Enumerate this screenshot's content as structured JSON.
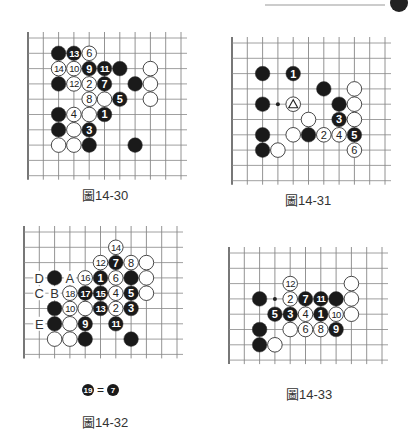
{
  "page_header": {
    "rule_visible": true
  },
  "figures": [
    {
      "id": "fig-14-30",
      "caption": "圖14-30",
      "origin": [
        28,
        38
      ],
      "spacing": 15.3,
      "cols": 11,
      "rows": 10,
      "left_edge": true,
      "stones": [
        {
          "c": 2,
          "r": 1,
          "color": "black",
          "label": ""
        },
        {
          "c": 3,
          "r": 1,
          "color": "black",
          "label": "13"
        },
        {
          "c": 4,
          "r": 1,
          "color": "white",
          "label": "6"
        },
        {
          "c": 2,
          "r": 2,
          "color": "white",
          "label": "14"
        },
        {
          "c": 3,
          "r": 2,
          "color": "white",
          "label": "10"
        },
        {
          "c": 4,
          "r": 2,
          "color": "black",
          "label": "9"
        },
        {
          "c": 5,
          "r": 2,
          "color": "black",
          "label": "11"
        },
        {
          "c": 6,
          "r": 2,
          "color": "black",
          "label": ""
        },
        {
          "c": 8,
          "r": 2,
          "color": "white",
          "label": ""
        },
        {
          "c": 2,
          "r": 3,
          "color": "black",
          "label": ""
        },
        {
          "c": 3,
          "r": 3,
          "color": "white",
          "label": "12"
        },
        {
          "c": 4,
          "r": 3,
          "color": "white",
          "label": "2"
        },
        {
          "c": 5,
          "r": 3,
          "color": "black",
          "label": "7"
        },
        {
          "c": 7,
          "r": 3,
          "color": "black",
          "label": ""
        },
        {
          "c": 8,
          "r": 3,
          "color": "white",
          "label": ""
        },
        {
          "c": 4,
          "r": 4,
          "color": "white",
          "label": "8"
        },
        {
          "c": 5,
          "r": 4,
          "color": "white",
          "label": ""
        },
        {
          "c": 6,
          "r": 4,
          "color": "black",
          "label": "5"
        },
        {
          "c": 8,
          "r": 4,
          "color": "white",
          "label": ""
        },
        {
          "c": 2,
          "r": 5,
          "color": "black",
          "label": ""
        },
        {
          "c": 3,
          "r": 5,
          "color": "white",
          "label": "4"
        },
        {
          "c": 4,
          "r": 5,
          "color": "white",
          "label": ""
        },
        {
          "c": 5,
          "r": 5,
          "color": "black",
          "label": "1"
        },
        {
          "c": 2,
          "r": 6,
          "color": "black",
          "label": ""
        },
        {
          "c": 3,
          "r": 6,
          "color": "white",
          "label": ""
        },
        {
          "c": 4,
          "r": 6,
          "color": "black",
          "label": "3"
        },
        {
          "c": 2,
          "r": 7,
          "color": "white",
          "label": ""
        },
        {
          "c": 3,
          "r": 7,
          "color": "white",
          "label": ""
        },
        {
          "c": 4,
          "r": 7,
          "color": "black",
          "label": ""
        },
        {
          "c": 7,
          "r": 7,
          "color": "black",
          "label": ""
        }
      ],
      "marks": [],
      "letters": []
    },
    {
      "id": "fig-14-31",
      "caption": "圖14-31",
      "origin": [
        232,
        43
      ],
      "spacing": 15.3,
      "cols": 11,
      "rows": 10,
      "left_edge": true,
      "stones": [
        {
          "c": 2,
          "r": 2,
          "color": "black",
          "label": ""
        },
        {
          "c": 4,
          "r": 2,
          "color": "black",
          "label": "1"
        },
        {
          "c": 6,
          "r": 3,
          "color": "black",
          "label": ""
        },
        {
          "c": 8,
          "r": 3,
          "color": "white",
          "label": ""
        },
        {
          "c": 2,
          "r": 4,
          "color": "black",
          "label": ""
        },
        {
          "c": 4,
          "r": 4,
          "color": "white",
          "label": "",
          "triangle": true
        },
        {
          "c": 7,
          "r": 4,
          "color": "black",
          "label": ""
        },
        {
          "c": 8,
          "r": 4,
          "color": "white",
          "label": ""
        },
        {
          "c": 5,
          "r": 5,
          "color": "white",
          "label": ""
        },
        {
          "c": 7,
          "r": 5,
          "color": "black",
          "label": "3"
        },
        {
          "c": 8,
          "r": 5,
          "color": "white",
          "label": ""
        },
        {
          "c": 2,
          "r": 6,
          "color": "black",
          "label": ""
        },
        {
          "c": 4,
          "r": 6,
          "color": "white",
          "label": ""
        },
        {
          "c": 5,
          "r": 6,
          "color": "black",
          "label": ""
        },
        {
          "c": 6,
          "r": 6,
          "color": "white",
          "label": "2"
        },
        {
          "c": 7,
          "r": 6,
          "color": "white",
          "label": "4"
        },
        {
          "c": 8,
          "r": 6,
          "color": "black",
          "label": "5"
        },
        {
          "c": 2,
          "r": 7,
          "color": "black",
          "label": ""
        },
        {
          "c": 3,
          "r": 7,
          "color": "white",
          "label": ""
        },
        {
          "c": 8,
          "r": 7,
          "color": "white",
          "label": "6"
        }
      ],
      "marks": [
        {
          "c": 3,
          "r": 4,
          "type": "hoshi"
        }
      ],
      "letters": []
    },
    {
      "id": "fig-14-32",
      "caption": "圖14-32",
      "origin": [
        24,
        232
      ],
      "spacing": 15.3,
      "cols": 11,
      "rows": 9,
      "left_edge": true,
      "stones": [
        {
          "c": 6,
          "r": 1,
          "color": "white",
          "label": "14"
        },
        {
          "c": 5,
          "r": 2,
          "color": "white",
          "label": "12"
        },
        {
          "c": 6,
          "r": 2,
          "color": "black",
          "label": "7"
        },
        {
          "c": 7,
          "r": 2,
          "color": "white",
          "label": "8"
        },
        {
          "c": 8,
          "r": 2,
          "color": "white",
          "label": ""
        },
        {
          "c": 2,
          "r": 3,
          "color": "black",
          "label": ""
        },
        {
          "c": 4,
          "r": 3,
          "color": "white",
          "label": "16"
        },
        {
          "c": 5,
          "r": 3,
          "color": "black",
          "label": "1"
        },
        {
          "c": 6,
          "r": 3,
          "color": "white",
          "label": "6"
        },
        {
          "c": 7,
          "r": 3,
          "color": "black",
          "label": ""
        },
        {
          "c": 8,
          "r": 3,
          "color": "white",
          "label": ""
        },
        {
          "c": 3,
          "r": 4,
          "color": "white",
          "label": "18"
        },
        {
          "c": 4,
          "r": 4,
          "color": "black",
          "label": "17"
        },
        {
          "c": 5,
          "r": 4,
          "color": "black",
          "label": "15"
        },
        {
          "c": 6,
          "r": 4,
          "color": "white",
          "label": "4"
        },
        {
          "c": 7,
          "r": 4,
          "color": "black",
          "label": "5"
        },
        {
          "c": 8,
          "r": 4,
          "color": "white",
          "label": ""
        },
        {
          "c": 2,
          "r": 5,
          "color": "black",
          "label": ""
        },
        {
          "c": 3,
          "r": 5,
          "color": "white",
          "label": "10"
        },
        {
          "c": 4,
          "r": 5,
          "color": "white",
          "label": ""
        },
        {
          "c": 5,
          "r": 5,
          "color": "black",
          "label": "13"
        },
        {
          "c": 6,
          "r": 5,
          "color": "white",
          "label": "2"
        },
        {
          "c": 7,
          "r": 5,
          "color": "black",
          "label": "3"
        },
        {
          "c": 2,
          "r": 6,
          "color": "black",
          "label": ""
        },
        {
          "c": 3,
          "r": 6,
          "color": "white",
          "label": ""
        },
        {
          "c": 4,
          "r": 6,
          "color": "black",
          "label": "9"
        },
        {
          "c": 6,
          "r": 6,
          "color": "black",
          "label": "11"
        },
        {
          "c": 2,
          "r": 7,
          "color": "white",
          "label": ""
        },
        {
          "c": 3,
          "r": 7,
          "color": "white",
          "label": ""
        },
        {
          "c": 4,
          "r": 7,
          "color": "black",
          "label": ""
        },
        {
          "c": 7,
          "r": 7,
          "color": "black",
          "label": ""
        }
      ],
      "marks": [],
      "letters": [
        {
          "c": 1,
          "r": 3,
          "text": "D"
        },
        {
          "c": 3,
          "r": 3,
          "text": "A"
        },
        {
          "c": 1,
          "r": 4,
          "text": "C"
        },
        {
          "c": 2,
          "r": 4,
          "text": "B"
        },
        {
          "c": 1,
          "r": 6,
          "text": "E"
        }
      ]
    },
    {
      "id": "fig-14-33",
      "caption": "圖14-33",
      "origin": [
        229,
        253
      ],
      "spacing": 15.3,
      "cols": 11,
      "rows": 8,
      "left_edge": true,
      "stones": [
        {
          "c": 8,
          "r": 2,
          "color": "white",
          "label": ""
        },
        {
          "c": 4,
          "r": 2,
          "color": "white",
          "label": "12"
        },
        {
          "c": 2,
          "r": 3,
          "color": "black",
          "label": ""
        },
        {
          "c": 4,
          "r": 3,
          "color": "white",
          "label": "2"
        },
        {
          "c": 5,
          "r": 3,
          "color": "black",
          "label": "7"
        },
        {
          "c": 6,
          "r": 3,
          "color": "black",
          "label": "11"
        },
        {
          "c": 7,
          "r": 3,
          "color": "black",
          "label": ""
        },
        {
          "c": 8,
          "r": 3,
          "color": "white",
          "label": ""
        },
        {
          "c": 3,
          "r": 4,
          "color": "black",
          "label": "5"
        },
        {
          "c": 4,
          "r": 4,
          "color": "black",
          "label": "3"
        },
        {
          "c": 5,
          "r": 4,
          "color": "white",
          "label": "4"
        },
        {
          "c": 6,
          "r": 4,
          "color": "black",
          "label": "1"
        },
        {
          "c": 7,
          "r": 4,
          "color": "white",
          "label": "10"
        },
        {
          "c": 8,
          "r": 4,
          "color": "white",
          "label": ""
        },
        {
          "c": 2,
          "r": 5,
          "color": "black",
          "label": ""
        },
        {
          "c": 4,
          "r": 5,
          "color": "white",
          "label": ""
        },
        {
          "c": 5,
          "r": 5,
          "color": "white",
          "label": "6"
        },
        {
          "c": 6,
          "r": 5,
          "color": "white",
          "label": "8"
        },
        {
          "c": 7,
          "r": 5,
          "color": "black",
          "label": "9"
        },
        {
          "c": 2,
          "r": 6,
          "color": "black",
          "label": ""
        },
        {
          "c": 3,
          "r": 6,
          "color": "white",
          "label": ""
        }
      ],
      "marks": [
        {
          "c": 3,
          "r": 3,
          "type": "hoshi"
        }
      ],
      "letters": []
    }
  ],
  "note_14_32": {
    "left": "19",
    "equals": "=",
    "right": "7"
  }
}
